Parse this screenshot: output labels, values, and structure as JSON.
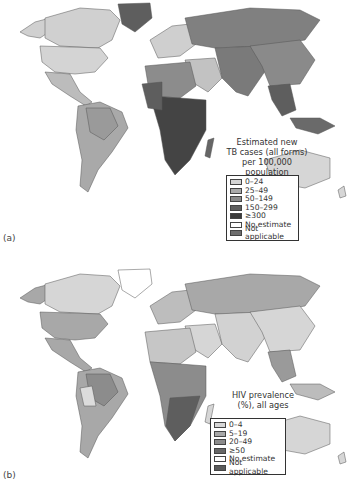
{
  "figure": {
    "panels": [
      {
        "label": "(a)",
        "legend_title_lines": [
          "Estimated new",
          "TB cases (all forms)",
          "per 100,000",
          "population"
        ],
        "legend": [
          {
            "label": "0–24",
            "color": "#d4d4d4"
          },
          {
            "label": "25–49",
            "color": "#a9a9a9"
          },
          {
            "label": "50–149",
            "color": "#8a8a8a"
          },
          {
            "label": "150–299",
            "color": "#5e5e5e"
          },
          {
            "label": "≥300",
            "color": "#3a3a3a"
          },
          {
            "label": "No estimate",
            "color": "#ffffff"
          },
          {
            "label": "Not applicable",
            "color": "#6e6e6e"
          }
        ]
      },
      {
        "label": "(b)",
        "legend_title_lines": [
          "HIV prevalence",
          "(%), all ages"
        ],
        "legend": [
          {
            "label": "0–4",
            "color": "#d6d6d6"
          },
          {
            "label": "5–19",
            "color": "#a8a8a8"
          },
          {
            "label": "20–49",
            "color": "#8c8c8c"
          },
          {
            "label": "≥50",
            "color": "#666666"
          },
          {
            "label": "No estimate",
            "color": "#ffffff"
          },
          {
            "label": "Not applicable",
            "color": "#5a5a5a"
          }
        ]
      }
    ]
  }
}
